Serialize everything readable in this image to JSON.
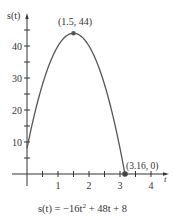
{
  "chart_data": {
    "type": "line",
    "title": "",
    "caption": "s(t) = −16t² + 48t + 8",
    "xlabel": "t",
    "ylabel": "s(t)",
    "xlim": [
      0,
      4.3
    ],
    "ylim": [
      0,
      48
    ],
    "x_ticks": [
      1,
      2,
      3,
      4
    ],
    "x_minor_ticks": [
      0.5,
      1.5,
      2.5,
      3.5
    ],
    "y_ticks": [
      10,
      20,
      30,
      40
    ],
    "y_minor_ticks": [
      5,
      15,
      25,
      35,
      45
    ],
    "grid": false,
    "series": [
      {
        "name": "s(t) = -16t^2 + 48t + 8",
        "function": "-16t^2+48t+8",
        "domain": [
          0,
          3.16
        ],
        "x": [
          0,
          0.5,
          1,
          1.5,
          2,
          2.5,
          3,
          3.16
        ],
        "values": [
          8,
          28,
          40,
          44,
          40,
          28,
          8,
          0
        ]
      }
    ],
    "annotations": [
      {
        "label": "(1.5, 44)",
        "x": 1.5,
        "y": 44
      },
      {
        "label": "(3.16, 0)",
        "x": 3.16,
        "y": 0
      }
    ]
  },
  "labels": {
    "y_axis": "s(t)",
    "x_axis": "t",
    "peak": "(1.5, 44)",
    "root": "(3.16, 0)",
    "caption_lhs": "s(t) = −16t",
    "caption_exp": "2",
    "caption_rhs": " + 48t + 8",
    "xt": [
      "1",
      "2",
      "3",
      "4"
    ],
    "yt": [
      "10",
      "20",
      "30",
      "40"
    ]
  }
}
